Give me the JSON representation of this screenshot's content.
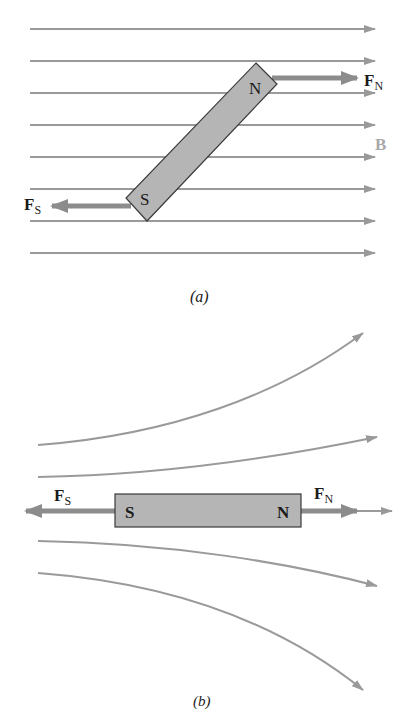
{
  "colors": {
    "field_line": "#9a9a9a",
    "force_arrow": "#8c8c8c",
    "magnet_fill": "#b5b5b5",
    "magnet_stroke": "#3a3a3a",
    "text": "#1a1a1a",
    "field_label": "#a8a8a8"
  },
  "panel_a": {
    "caption": "(a)",
    "field_label": "B",
    "field_line_count": 8,
    "magnet": {
      "north_label": "N",
      "south_label": "S"
    },
    "forces": {
      "north": {
        "symbol": "F",
        "subscript": "N"
      },
      "south": {
        "symbol": "F",
        "subscript": "S"
      }
    }
  },
  "panel_b": {
    "caption": "(b)",
    "field_line_count": 5,
    "magnet": {
      "north_label": "N",
      "south_label": "S"
    },
    "forces": {
      "north": {
        "symbol": "F",
        "subscript": "N"
      },
      "south": {
        "symbol": "F",
        "subscript": "S"
      }
    }
  }
}
